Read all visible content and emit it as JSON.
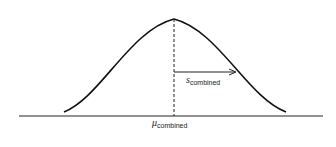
{
  "diagram": {
    "type": "normal-distribution",
    "labels": {
      "sigma": {
        "main": "s",
        "sub": "combined"
      },
      "mu": {
        "main": "μ",
        "sub": "combined"
      }
    },
    "colors": {
      "stroke": "#111111",
      "background": "#ffffff"
    }
  }
}
